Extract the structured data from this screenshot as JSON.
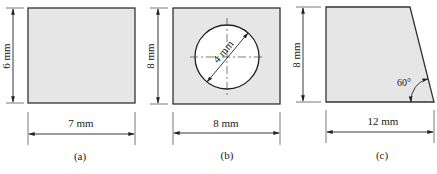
{
  "figures": [
    {
      "id": "a",
      "caption": "(a)",
      "shape": "rectangle",
      "height_label": "6 mm",
      "width_label": "7 mm"
    },
    {
      "id": "b",
      "caption": "(b)",
      "shape": "square-with-circular-hole",
      "height_label": "8 mm",
      "width_label": "8 mm",
      "hole_diameter_label": "4 mm"
    },
    {
      "id": "c",
      "caption": "(c)",
      "shape": "trapezoid",
      "height_label": "8 mm",
      "width_label": "12 mm",
      "angle_label": "60°"
    }
  ],
  "colors": {
    "fill": "#e6e6e6",
    "stroke": "#333333",
    "hole_fill": "#ffffff"
  }
}
